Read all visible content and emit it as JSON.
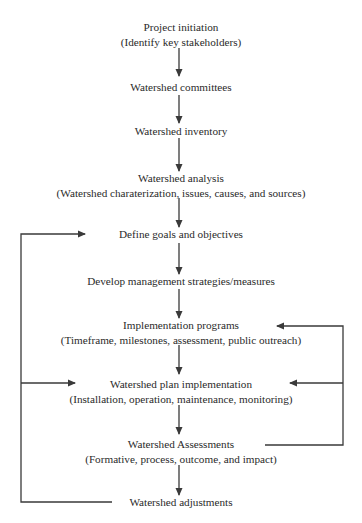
{
  "diagram": {
    "type": "flowchart",
    "nodes": [
      {
        "id": "project-initiation",
        "title": "Project initiation",
        "subtitle": "(Identify key stakeholders)"
      },
      {
        "id": "watershed-committees",
        "title": "Watershed committees",
        "subtitle": ""
      },
      {
        "id": "watershed-inventory",
        "title": "Watershed inventory",
        "subtitle": ""
      },
      {
        "id": "watershed-analysis",
        "title": "Watershed analysis",
        "subtitle": "(Watershed charaterization, issues, causes, and sources)"
      },
      {
        "id": "define-goals",
        "title": "Define goals and objectives",
        "subtitle": ""
      },
      {
        "id": "develop-strategies",
        "title": "Develop management strategies/measures",
        "subtitle": ""
      },
      {
        "id": "implementation-programs",
        "title": "Implementation programs",
        "subtitle": "(Timeframe, milestones, assessment, public outreach)"
      },
      {
        "id": "plan-implementation",
        "title": "Watershed plan implementation",
        "subtitle": "(Installation, operation, maintenance, monitoring)"
      },
      {
        "id": "watershed-assessments",
        "title": "Watershed Assessments",
        "subtitle": "(Formative, process, outcome, and impact)"
      },
      {
        "id": "watershed-adjustments",
        "title": "Watershed adjustments",
        "subtitle": ""
      }
    ],
    "edges": [
      {
        "from": "project-initiation",
        "to": "watershed-committees"
      },
      {
        "from": "watershed-committees",
        "to": "watershed-inventory"
      },
      {
        "from": "watershed-inventory",
        "to": "watershed-analysis"
      },
      {
        "from": "watershed-analysis",
        "to": "define-goals"
      },
      {
        "from": "define-goals",
        "to": "develop-strategies"
      },
      {
        "from": "develop-strategies",
        "to": "implementation-programs"
      },
      {
        "from": "implementation-programs",
        "to": "plan-implementation"
      },
      {
        "from": "plan-implementation",
        "to": "watershed-assessments"
      },
      {
        "from": "watershed-assessments",
        "to": "watershed-adjustments"
      },
      {
        "from": "watershed-adjustments",
        "to": "define-goals",
        "route": "left-loop"
      },
      {
        "from": "watershed-adjustments",
        "to": "plan-implementation",
        "route": "left-loop"
      },
      {
        "from": "watershed-assessments",
        "to": "implementation-programs",
        "route": "right-loop"
      },
      {
        "from": "watershed-assessments",
        "to": "plan-implementation",
        "route": "right-loop"
      }
    ],
    "line_color": "#3a3a3a"
  }
}
